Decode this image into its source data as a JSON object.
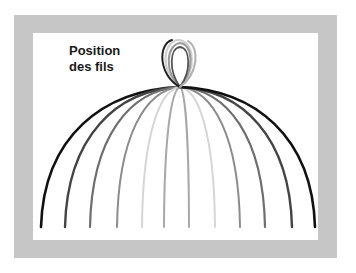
{
  "diagram": {
    "title_line1": "Position",
    "title_line2": "des fils",
    "apex": {
      "x": 180,
      "y": 87
    },
    "frame_color": "#c6c6c6",
    "background_color": "#ffffff",
    "wires": [
      {
        "side": "left",
        "end_x": 41,
        "color": "#111111",
        "width": 2.6
      },
      {
        "side": "left",
        "end_x": 65,
        "color": "#444444",
        "width": 2.4
      },
      {
        "side": "left",
        "end_x": 90,
        "color": "#6e6e6e",
        "width": 2.2
      },
      {
        "side": "left",
        "end_x": 117,
        "color": "#8c8c8c",
        "width": 2.0
      },
      {
        "side": "left",
        "end_x": 142,
        "color": "#d6d6d6",
        "width": 2.0
      },
      {
        "side": "left",
        "end_x": 164,
        "color": "#a8a8a8",
        "width": 2.0
      },
      {
        "side": "right",
        "end_x": 189,
        "color": "#a8a8a8",
        "width": 2.0
      },
      {
        "side": "right",
        "end_x": 215,
        "color": "#d6d6d6",
        "width": 2.0
      },
      {
        "side": "right",
        "end_x": 240,
        "color": "#8c8c8c",
        "width": 2.0
      },
      {
        "side": "right",
        "end_x": 265,
        "color": "#6e6e6e",
        "width": 2.2
      },
      {
        "side": "right",
        "end_x": 292,
        "color": "#444444",
        "width": 2.4
      },
      {
        "side": "right",
        "end_x": 315,
        "color": "#111111",
        "width": 2.6
      }
    ],
    "wire_end_y": 227
  }
}
